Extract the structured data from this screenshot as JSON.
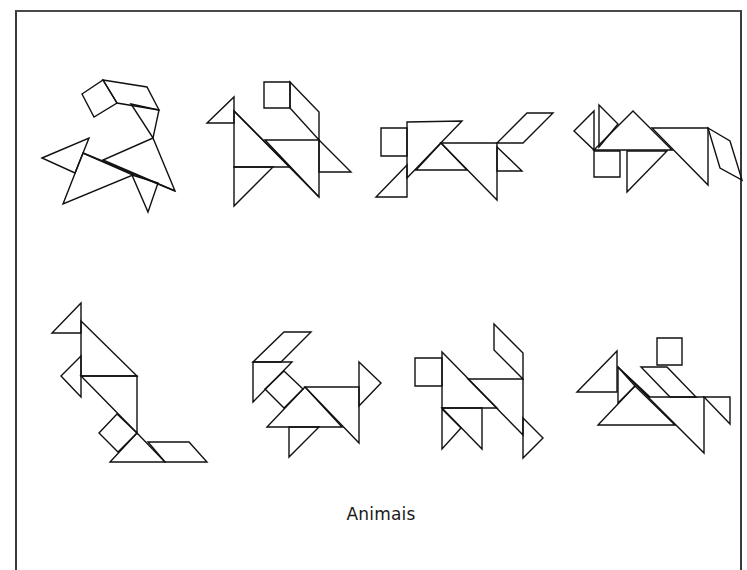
{
  "caption": "Animais",
  "colors": {
    "background": "#ffffff",
    "stroke": "#111111",
    "frame": "#3a3a3a"
  },
  "figures": [
    {
      "name": "animal-1",
      "polygons": [
        [
          [
            82,
            94
          ],
          [
            103,
            80
          ],
          [
            117,
            103
          ],
          [
            94,
            117
          ]
        ],
        [
          [
            103,
            80
          ],
          [
            147,
            87
          ],
          [
            159,
            110
          ],
          [
            117,
            103
          ]
        ],
        [
          [
            131,
            104
          ],
          [
            159,
            110
          ],
          [
            153,
            138
          ]
        ],
        [
          [
            42,
            158
          ],
          [
            89,
            138
          ],
          [
            75,
            173
          ]
        ],
        [
          [
            83,
            153
          ],
          [
            63,
            204
          ],
          [
            133,
            175
          ]
        ],
        [
          [
            153,
            138
          ],
          [
            175,
            191
          ],
          [
            103,
            160
          ]
        ],
        [
          [
            132,
            175
          ],
          [
            158,
            183
          ],
          [
            148,
            212
          ]
        ]
      ],
      "lines": [
        [
          [
            83,
            153
          ],
          [
            175,
            191
          ]
        ]
      ]
    },
    {
      "name": "animal-2",
      "polygons": [
        [
          [
            264,
            82
          ],
          [
            290,
            82
          ],
          [
            290,
            108
          ],
          [
            264,
            108
          ]
        ],
        [
          [
            290,
            82
          ],
          [
            319,
            112
          ],
          [
            319,
            140
          ],
          [
            290,
            108
          ]
        ],
        [
          [
            207,
            123
          ],
          [
            234,
            97
          ],
          [
            234,
            123
          ]
        ],
        [
          [
            234,
            111
          ],
          [
            234,
            167
          ],
          [
            290,
            167
          ]
        ],
        [
          [
            265,
            140
          ],
          [
            319,
            140
          ],
          [
            319,
            197
          ]
        ],
        [
          [
            319,
            140
          ],
          [
            351,
            172
          ],
          [
            319,
            172
          ]
        ],
        [
          [
            234,
            167
          ],
          [
            273,
            167
          ],
          [
            234,
            206
          ]
        ]
      ],
      "lines": [
        [
          [
            234,
            111
          ],
          [
            319,
            197
          ]
        ]
      ]
    },
    {
      "name": "animal-3",
      "polygons": [
        [
          [
            381,
            128
          ],
          [
            407,
            128
          ],
          [
            407,
            156
          ],
          [
            381,
            156
          ]
        ],
        [
          [
            407,
            122
          ],
          [
            462,
            121
          ],
          [
            407,
            178
          ]
        ],
        [
          [
            441,
            143
          ],
          [
            416,
            170
          ],
          [
            467,
            170
          ]
        ],
        [
          [
            441,
            143
          ],
          [
            497,
            143
          ],
          [
            497,
            200
          ]
        ],
        [
          [
            407,
            165
          ],
          [
            407,
            197
          ],
          [
            376,
            197
          ]
        ],
        [
          [
            497,
            143
          ],
          [
            527,
            113
          ],
          [
            553,
            113
          ],
          [
            523,
            143
          ]
        ],
        [
          [
            497,
            147
          ],
          [
            522,
            171
          ],
          [
            497,
            171
          ]
        ]
      ],
      "lines": []
    },
    {
      "name": "animal-4",
      "polygons": [
        [
          [
            574,
            131
          ],
          [
            594,
            111
          ],
          [
            594,
            150
          ]
        ],
        [
          [
            599,
            105
          ],
          [
            618,
            124
          ],
          [
            599,
            147
          ]
        ],
        [
          [
            594,
            150
          ],
          [
            633,
            111
          ],
          [
            672,
            150
          ]
        ],
        [
          [
            594,
            151
          ],
          [
            620,
            151
          ],
          [
            620,
            177
          ],
          [
            594,
            177
          ]
        ],
        [
          [
            627,
            151
          ],
          [
            667,
            151
          ],
          [
            627,
            192
          ]
        ],
        [
          [
            652,
            128
          ],
          [
            708,
            128
          ],
          [
            708,
            185
          ]
        ],
        [
          [
            708,
            128
          ],
          [
            730,
            141
          ],
          [
            742,
            180
          ],
          [
            720,
            168
          ]
        ]
      ],
      "lines": []
    },
    {
      "name": "animal-5",
      "polygons": [
        [
          [
            81,
            303
          ],
          [
            81,
            333
          ],
          [
            52,
            333
          ]
        ],
        [
          [
            81,
            321
          ],
          [
            137,
            376
          ],
          [
            81,
            376
          ]
        ],
        [
          [
            81,
            356
          ],
          [
            61,
            376
          ],
          [
            81,
            397
          ]
        ],
        [
          [
            81,
            376
          ],
          [
            137,
            376
          ],
          [
            137,
            433
          ]
        ],
        [
          [
            117,
            414
          ],
          [
            99,
            433
          ],
          [
            118,
            452
          ],
          [
            137,
            433
          ]
        ],
        [
          [
            137,
            433
          ],
          [
            110,
            462
          ],
          [
            165,
            462
          ]
        ],
        [
          [
            148,
            442
          ],
          [
            189,
            442
          ],
          [
            207,
            462
          ],
          [
            165,
            462
          ]
        ]
      ],
      "lines": []
    },
    {
      "name": "animal-6",
      "polygons": [
        [
          [
            253,
            362
          ],
          [
            284,
            332
          ],
          [
            311,
            332
          ],
          [
            281,
            362
          ]
        ],
        [
          [
            253,
            362
          ],
          [
            292,
            362
          ],
          [
            253,
            402
          ]
        ],
        [
          [
            284,
            371
          ],
          [
            303,
            389
          ],
          [
            284,
            408
          ],
          [
            265,
            389
          ]
        ],
        [
          [
            305,
            387
          ],
          [
            267,
            427
          ],
          [
            342,
            427
          ]
        ],
        [
          [
            305,
            387
          ],
          [
            359,
            387
          ],
          [
            359,
            443
          ]
        ],
        [
          [
            359,
            362
          ],
          [
            381,
            383
          ],
          [
            359,
            406
          ]
        ],
        [
          [
            289,
            427
          ],
          [
            319,
            427
          ],
          [
            289,
            457
          ]
        ]
      ],
      "lines": []
    },
    {
      "name": "animal-7",
      "polygons": [
        [
          [
            415,
            358
          ],
          [
            442,
            358
          ],
          [
            442,
            386
          ],
          [
            415,
            386
          ]
        ],
        [
          [
            442,
            352
          ],
          [
            497,
            408
          ],
          [
            442,
            408
          ]
        ],
        [
          [
            494,
            324
          ],
          [
            523,
            353
          ],
          [
            523,
            379
          ],
          [
            494,
            350
          ]
        ],
        [
          [
            468,
            379
          ],
          [
            523,
            379
          ],
          [
            523,
            435
          ]
        ],
        [
          [
            442,
            408
          ],
          [
            482,
            408
          ],
          [
            482,
            449
          ]
        ],
        [
          [
            442,
            409
          ],
          [
            461,
            428
          ],
          [
            442,
            449
          ]
        ],
        [
          [
            523,
            418
          ],
          [
            543,
            438
          ],
          [
            523,
            458
          ]
        ]
      ],
      "lines": []
    },
    {
      "name": "animal-8",
      "polygons": [
        [
          [
            657,
            338
          ],
          [
            682,
            338
          ],
          [
            682,
            365
          ],
          [
            657,
            365
          ]
        ],
        [
          [
            577,
            392
          ],
          [
            617,
            351
          ],
          [
            617,
            392
          ]
        ],
        [
          [
            618,
            367
          ],
          [
            635,
            386
          ],
          [
            618,
            403
          ]
        ],
        [
          [
            641,
            367
          ],
          [
            667,
            367
          ],
          [
            696,
            397
          ],
          [
            670,
            397
          ]
        ],
        [
          [
            635,
            386
          ],
          [
            598,
            425
          ],
          [
            675,
            425
          ]
        ],
        [
          [
            618,
            367
          ],
          [
            704,
            453
          ],
          [
            704,
            397
          ],
          [
            650,
            397
          ]
        ],
        [
          [
            704,
            397
          ],
          [
            730,
            397
          ],
          [
            730,
            424
          ]
        ]
      ],
      "lines": []
    }
  ]
}
